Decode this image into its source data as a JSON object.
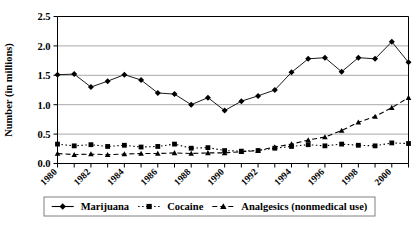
{
  "chart_data": {
    "type": "line",
    "title": "",
    "xlabel": "",
    "ylabel": "Number (in millions)",
    "ylim": [
      0.0,
      2.5
    ],
    "ytick_labels": [
      "0.0",
      "0.5",
      "1.0",
      "1.5",
      "2.0",
      "2.5"
    ],
    "ytick_values": [
      0.0,
      0.5,
      1.0,
      1.5,
      2.0,
      2.5
    ],
    "grid": true,
    "legend_position": "bottom",
    "x": [
      1980,
      1981,
      1982,
      1983,
      1984,
      1985,
      1986,
      1987,
      1988,
      1989,
      1990,
      1991,
      1992,
      1993,
      1994,
      1995,
      1996,
      1997,
      1998,
      1999,
      2000,
      2001
    ],
    "xtick_labels": [
      "1980",
      "1982",
      "1984",
      "1986",
      "1988",
      "1990",
      "1992",
      "1994",
      "1996",
      "1998",
      "2000"
    ],
    "xtick_values": [
      1980,
      1982,
      1984,
      1986,
      1988,
      1990,
      1992,
      1994,
      1996,
      1998,
      2000
    ],
    "series": [
      {
        "name": "Marijuana",
        "marker": "diamond",
        "line_style": "solid",
        "color": "#000000",
        "values": [
          1.51,
          1.52,
          1.3,
          1.4,
          1.51,
          1.42,
          1.2,
          1.18,
          1.0,
          1.12,
          0.9,
          1.06,
          1.15,
          1.25,
          1.55,
          1.78,
          1.8,
          1.56,
          1.8,
          1.78,
          2.07,
          1.72
        ]
      },
      {
        "name": "Cocaine",
        "marker": "square",
        "line_style": "dotted",
        "color": "#000000",
        "values": [
          0.33,
          0.3,
          0.32,
          0.29,
          0.31,
          0.28,
          0.29,
          0.33,
          0.26,
          0.27,
          0.22,
          0.21,
          0.22,
          0.26,
          0.29,
          0.32,
          0.3,
          0.33,
          0.31,
          0.3,
          0.35,
          0.34
        ]
      },
      {
        "name": "Analgesics (nonmedical use)",
        "marker": "triangle",
        "line_style": "dashed",
        "color": "#000000",
        "values": [
          0.17,
          0.15,
          0.16,
          0.15,
          0.16,
          0.17,
          0.17,
          0.18,
          0.17,
          0.18,
          0.18,
          0.2,
          0.22,
          0.28,
          0.33,
          0.4,
          0.45,
          0.56,
          0.7,
          0.8,
          0.95,
          1.12
        ]
      }
    ]
  },
  "legend": {
    "items": [
      {
        "label": "Marijuana",
        "marker": "diamond-icon",
        "line": "solid"
      },
      {
        "label": "Cocaine",
        "marker": "square-icon",
        "line": "dotted"
      },
      {
        "label": "Analgesics (nonmedical use)",
        "marker": "triangle-icon",
        "line": "dashed"
      }
    ]
  }
}
